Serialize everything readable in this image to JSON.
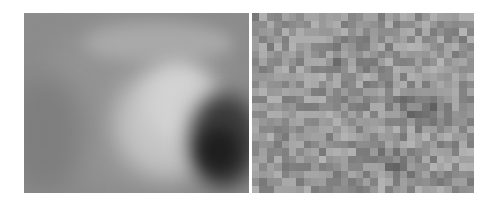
{
  "figure": {
    "panels": [
      {
        "id": "left",
        "description": "Smooth blurred grayscale image: light bright region upper-center with a dark crescent at lower right",
        "base_color": "#8c8c8c",
        "blobs": [
          {
            "x": 10,
            "y": 5,
            "w": 200,
            "h": 170,
            "color": "#949494",
            "blur": 12
          },
          {
            "x": 60,
            "y": 10,
            "w": 150,
            "h": 40,
            "color": "#a9a9a9",
            "blur": 8
          },
          {
            "x": 90,
            "y": 55,
            "w": 110,
            "h": 110,
            "color": "#c4c4c4",
            "blur": 12
          },
          {
            "x": 120,
            "y": 50,
            "w": 70,
            "h": 80,
            "color": "#d2d2d2",
            "blur": 10
          },
          {
            "x": 165,
            "y": 80,
            "w": 70,
            "h": 95,
            "color": "#3a3a3a",
            "blur": 10
          },
          {
            "x": 175,
            "y": 115,
            "w": 40,
            "h": 45,
            "color": "#1e1e1e",
            "blur": 8
          },
          {
            "x": -20,
            "y": 60,
            "w": 80,
            "h": 120,
            "color": "#7e7e7e",
            "blur": 14
          }
        ]
      },
      {
        "id": "right",
        "description": "Noisy pixelated grayscale mosaic with darker cluster center-right",
        "cols": 30,
        "rows": 24,
        "seed": 7,
        "base_gray": 150,
        "noise_range": 60,
        "dark_spots": [
          {
            "cx": 0.75,
            "cy": 0.5,
            "r": 0.15,
            "strength": 55
          },
          {
            "cx": 0.63,
            "cy": 0.83,
            "r": 0.1,
            "strength": 50
          },
          {
            "cx": 0.55,
            "cy": 0.75,
            "r": 0.08,
            "strength": 35
          },
          {
            "cx": 0.4,
            "cy": 0.25,
            "r": 0.12,
            "strength": 20
          }
        ]
      }
    ]
  }
}
